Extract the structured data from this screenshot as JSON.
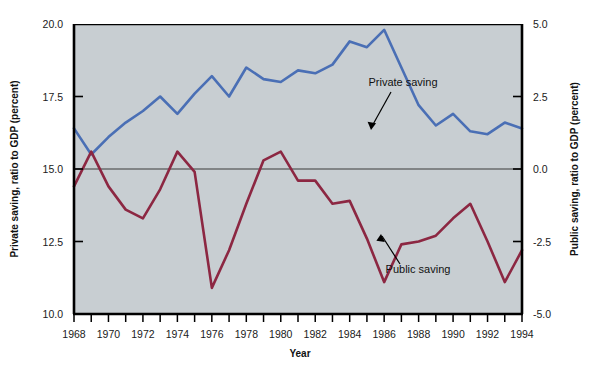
{
  "chart_data": {
    "type": "line",
    "title": "",
    "xlabel": "Year",
    "ylabel_left": "Private saving, ratio to GDP (percent)",
    "ylabel_right": "Public saving, ratio to GDP (percent)",
    "x": [
      1968,
      1969,
      1970,
      1971,
      1972,
      1973,
      1974,
      1975,
      1976,
      1977,
      1978,
      1979,
      1980,
      1981,
      1982,
      1983,
      1984,
      1985,
      1986,
      1987,
      1988,
      1989,
      1990,
      1991,
      1992,
      1993,
      1994
    ],
    "xlim": [
      1968,
      1994
    ],
    "xticks": [
      1968,
      1969,
      1970,
      1971,
      1972,
      1973,
      1974,
      1975,
      1976,
      1977,
      1978,
      1979,
      1980,
      1981,
      1982,
      1983,
      1984,
      1985,
      1986,
      1987,
      1988,
      1989,
      1990,
      1991,
      1992,
      1993,
      1994
    ],
    "xtick_labels_shown": [
      1968,
      1970,
      1972,
      1974,
      1976,
      1978,
      1980,
      1982,
      1984,
      1986,
      1988,
      1990,
      1992,
      1994
    ],
    "ylim_left": [
      10.0,
      20.0
    ],
    "yticks_left": [
      10.0,
      12.5,
      15.0,
      17.5,
      20.0
    ],
    "ytick_labels_left": [
      "10.0",
      "12.5",
      "15.0",
      "17.5",
      "20.0"
    ],
    "ylim_right": [
      -5.0,
      5.0
    ],
    "yticks_right": [
      -5.0,
      -2.5,
      0.0,
      2.5,
      5.0
    ],
    "ytick_labels_right": [
      "-5.0",
      "-2.5",
      "0.0",
      "2.5",
      "5.0"
    ],
    "zero_line_right": 0.0,
    "grid": false,
    "legend_position": "inline-annotations",
    "plot_background": "#c8ced2",
    "series": [
      {
        "name": "Private saving",
        "axis": "left",
        "color": "#4a6fb5",
        "values": [
          16.4,
          15.5,
          16.1,
          16.6,
          17.0,
          17.5,
          16.9,
          17.6,
          18.2,
          17.5,
          18.5,
          18.1,
          18.0,
          18.4,
          18.3,
          18.6,
          19.4,
          19.2,
          19.8,
          18.5,
          17.2,
          16.5,
          16.9,
          16.3,
          16.2,
          16.6,
          16.4
        ],
        "annotation": {
          "text": "Private saving",
          "point_year": 1987,
          "point_value": 16.3
        }
      },
      {
        "name": "Public saving",
        "axis": "right",
        "color": "#8c2742",
        "values": [
          -0.6,
          0.6,
          -0.6,
          -1.4,
          -1.7,
          -0.7,
          0.6,
          -0.1,
          -4.1,
          -2.8,
          -1.2,
          0.3,
          0.6,
          -0.4,
          -0.4,
          -1.2,
          -1.1,
          -2.4,
          -3.9,
          -2.6,
          -2.5,
          -2.3,
          -1.7,
          -1.2,
          -2.5,
          -3.9,
          -2.8
        ],
        "annotation": {
          "text": "Public saving",
          "point_year": 1986,
          "point_value": -2.2
        }
      }
    ]
  },
  "axes": {
    "x_title": "Year",
    "left_title": "Private saving, ratio to GDP (percent)",
    "right_title": "Public saving, ratio to GDP (percent)"
  },
  "annotations": {
    "private": "Private saving",
    "public": "Public saving"
  },
  "colors": {
    "private_line": "#4a6fb5",
    "public_line": "#8c2742",
    "plot_background": "#c8ced2",
    "axis": "#000000",
    "zero_line": "#333333",
    "page_background": "#ffffff"
  }
}
